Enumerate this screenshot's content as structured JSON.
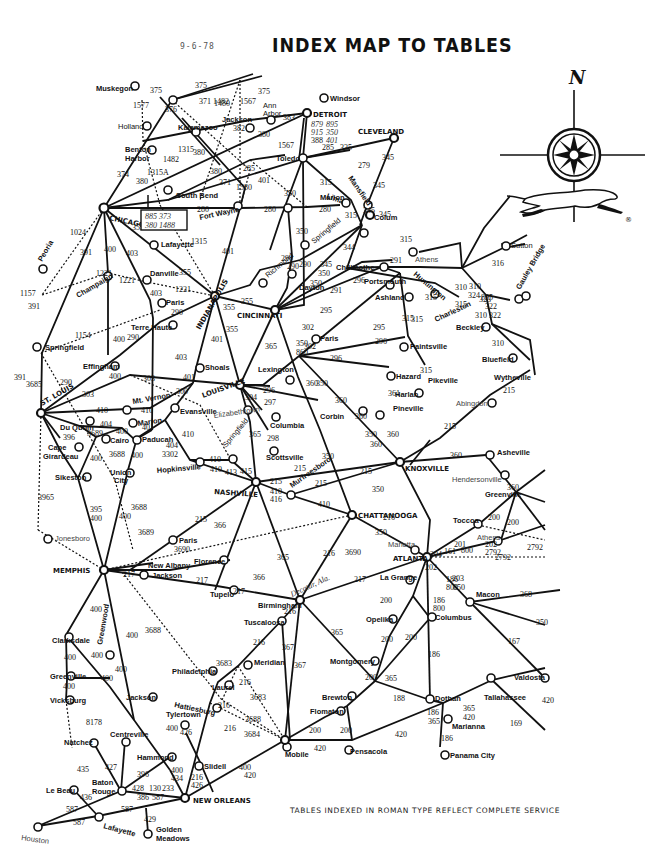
{
  "header": {
    "date": "9-6-78",
    "title": "INDEX MAP TO TABLES"
  },
  "footer": {
    "note": "TABLES INDEXED IN ROMAN TYPE REFLECT COMPLETE SERVICE"
  },
  "legend": {
    "compass_north_label": "N",
    "logo": "running-greyhound-icon",
    "registered_mark": "®"
  },
  "hubs": [
    {
      "name": "CHICAGO",
      "x": 104,
      "y": 208
    },
    {
      "name": "DETROIT",
      "x": 307,
      "y": 113
    },
    {
      "name": "CLEVELAND",
      "x": 394,
      "y": 138
    },
    {
      "name": "INDIANAPOLIS",
      "x": 215,
      "y": 296
    },
    {
      "name": "CINCINNATI",
      "x": 275,
      "y": 310
    },
    {
      "name": "LOUISVILLE",
      "x": 240,
      "y": 385
    },
    {
      "name": "ST. LOUIS",
      "x": 41,
      "y": 413
    },
    {
      "name": "NASHVILLE",
      "x": 256,
      "y": 482
    },
    {
      "name": "KNOXVILLE",
      "x": 400,
      "y": 462
    },
    {
      "name": "CHATTANOOGA",
      "x": 352,
      "y": 515
    },
    {
      "name": "ATLANTA",
      "x": 427,
      "y": 557
    },
    {
      "name": "MEMPHIS",
      "x": 104,
      "y": 570
    },
    {
      "name": "NEW ORLEANS",
      "x": 185,
      "y": 798
    }
  ],
  "cities": [
    "Muskegon",
    "Holland",
    "Kalamazoo",
    "Benton Harbor",
    "Jackson",
    "Ann Arbor",
    "Windsor",
    "Toledo",
    "South Bend",
    "Fort Wayne",
    "Lima",
    "Marion",
    "Mansfield",
    "Colum",
    "Springfield",
    "Dayton",
    "Richmond",
    "Lafayette",
    "Peoria",
    "Champaign",
    "Danville",
    "Paris",
    "Terre Haute",
    "Springfield",
    "Effingham",
    "Shoals",
    "Mt. Vernon",
    "Evansville",
    "Marion",
    "Du Quoin",
    "Cairo",
    "Paducah",
    "Cape Girardeau",
    "Sikeston",
    "Union City",
    "Hopkinsville",
    "Springfield",
    "Elizabethtown",
    "Columbia",
    "Scottsville",
    "Chillicothe",
    "Athens",
    "Portsmouth",
    "Huntington",
    "Ashland",
    "Charleston",
    "Sutton",
    "Gauley Bridge",
    "Beckley",
    "Bluefield",
    "Wytheville",
    "Abingdon",
    "Paris",
    "Lexington",
    "Hazard",
    "Paintsville",
    "Pikeville",
    "Harlan",
    "Pineville",
    "Corbin",
    "Murfreesboro",
    "Asheville",
    "Hendersonville",
    "Greenville",
    "Toccoa",
    "Athens",
    "Marietta",
    "Jonesboro",
    "Paris",
    "Jackson",
    "New Albany",
    "Florence",
    "Tupelo",
    "Birmingham",
    "Tuscaloosa",
    "La Grange",
    "Opelika",
    "Columbus",
    "Macon",
    "Valdosta",
    "Montgomery",
    "Clarksdale",
    "Greenwood",
    "Greenville",
    "Vicksburg",
    "Jackson",
    "Philadelphia",
    "Meridian",
    "Laurel",
    "Hattiesburg",
    "Brewton",
    "Flomaton",
    "Dothan",
    "Tallahassee",
    "Marianna",
    "Panama City",
    "Pensacola",
    "Mobile",
    "Natchez",
    "Centreville",
    "Tylertown",
    "Hammond",
    "Slidell",
    "Baton Rouge",
    "Le Beau",
    "Lafayette",
    "Houston",
    "Golden Meadows"
  ],
  "table_labels_sample": [
    "375",
    "1577",
    "376",
    "1482",
    "1567",
    "382",
    "383",
    "380",
    "1315A",
    "1315",
    "285",
    "335",
    "279",
    "345",
    "315",
    "350",
    "280",
    "401",
    "1580",
    "371",
    "1024",
    "391",
    "400",
    "403",
    "355",
    "1221",
    "1157",
    "1154",
    "290",
    "303",
    "300",
    "3689",
    "410",
    "404",
    "3302",
    "413",
    "415",
    "216",
    "304",
    "297",
    "298",
    "365",
    "302",
    "296",
    "360",
    "361",
    "291",
    "295",
    "310",
    "324",
    "322",
    "316",
    "215",
    "3688",
    "3965",
    "3690",
    "217",
    "366",
    "200",
    "201",
    "202",
    "2792",
    "186",
    "203",
    "367",
    "3683",
    "3684",
    "188",
    "420",
    "169",
    "368",
    "167",
    "426",
    "427",
    "434",
    "435",
    "436",
    "587",
    "429"
  ],
  "detroit_box": [
    "879 895",
    "915 350",
    "388 401"
  ],
  "chicago_box": [
    "885 373",
    "380 1488"
  ]
}
